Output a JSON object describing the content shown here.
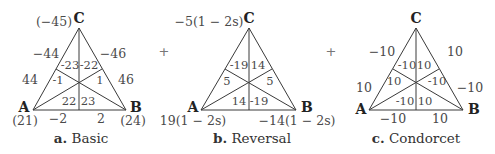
{
  "operator_between": "+",
  "diagrams": [
    {
      "caption_letter": "a.",
      "caption_text": "Basic",
      "vertices": {
        "A": "A",
        "B": "B",
        "C": "C"
      },
      "vertex_values": {
        "A": "(21)",
        "B": "(24)",
        "C": "(−45)"
      },
      "edge_labels": {
        "AC_outer_top": "−44",
        "AC_outer_bottom": "44",
        "BC_outer_top": "−46",
        "BC_outer_bottom": "46",
        "AB_left": "−2",
        "AB_right": "2"
      },
      "region_labels": {
        "top_left": "-23",
        "top_right": "-22",
        "mid_left": "-1",
        "mid_right": "1",
        "bottom_left": "22",
        "bottom_right": "23"
      }
    },
    {
      "caption_letter": "b.",
      "caption_text": "Reversal",
      "vertices": {
        "A": "A",
        "B": "B",
        "C": "C"
      },
      "vertex_values": {
        "A": "19(1 − 2s)",
        "B": "−14(1 − 2s)",
        "C": "−5(1 − 2s)"
      },
      "edge_labels": {},
      "region_labels": {
        "top_left": "-19",
        "top_right": "14",
        "mid_left": "5",
        "mid_right": "5",
        "bottom_left": "14",
        "bottom_right": "-19"
      }
    },
    {
      "caption_letter": "c.",
      "caption_text": "Condorcet",
      "vertices": {
        "A": "A",
        "B": "B",
        "C": "C"
      },
      "vertex_values": {},
      "edge_labels": {
        "AC_outer_top": "−10",
        "AC_outer_bottom": "10",
        "BC_outer_top": "10",
        "BC_outer_bottom": "−10",
        "AB_left": "−10",
        "AB_right": "10"
      },
      "region_labels": {
        "top_left": "-10",
        "top_right": "10",
        "mid_left": "10",
        "mid_right": "-10",
        "bottom_left": "-10",
        "bottom_right": "10"
      }
    }
  ]
}
